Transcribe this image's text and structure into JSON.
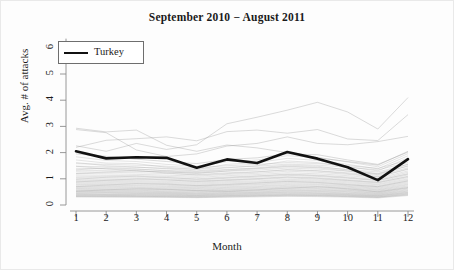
{
  "chart_data": {
    "type": "line",
    "title": "September 2010 − August 2011",
    "xlabel": "Month",
    "ylabel": "Avg. # of attacks",
    "xlim": [
      1,
      12
    ],
    "ylim": [
      0,
      6.4
    ],
    "xticks": [
      "1",
      "2",
      "3",
      "4",
      "5",
      "6",
      "7",
      "8",
      "9",
      "10",
      "11",
      "12"
    ],
    "yticks": [
      "0",
      "1",
      "2",
      "3",
      "4",
      "5",
      "6"
    ],
    "grid": false,
    "legend": {
      "position": "top-left",
      "entries": [
        "Turkey"
      ]
    },
    "x": [
      1,
      2,
      3,
      4,
      5,
      6,
      7,
      8,
      9,
      10,
      11,
      12
    ],
    "highlight_series": {
      "name": "Turkey",
      "color": "#111111",
      "width": 2.6,
      "values": [
        2.05,
        1.78,
        1.82,
        1.8,
        1.42,
        1.74,
        1.6,
        2.02,
        1.77,
        1.44,
        0.95,
        1.75
      ]
    },
    "background_series": [
      {
        "name": "bg-01",
        "values": [
          2.93,
          2.79,
          2.86,
          2.28,
          2.05,
          2.29,
          2.18,
          2.0,
          1.8,
          1.66,
          1.52,
          2.05
        ]
      },
      {
        "name": "bg-02",
        "values": [
          2.2,
          2.47,
          2.53,
          2.6,
          2.45,
          2.8,
          2.86,
          2.74,
          2.88,
          2.52,
          2.46,
          3.45
        ]
      },
      {
        "name": "bg-03",
        "values": [
          2.26,
          2.05,
          2.35,
          2.12,
          2.3,
          3.1,
          3.35,
          3.62,
          3.92,
          3.55,
          2.9,
          4.1
        ]
      },
      {
        "name": "bg-04",
        "values": [
          2.88,
          2.76,
          2.1,
          1.85,
          1.95,
          2.25,
          2.35,
          2.6,
          2.35,
          2.3,
          2.42,
          2.62
        ]
      },
      {
        "name": "bg-05",
        "values": [
          1.58,
          1.55,
          1.52,
          1.48,
          1.42,
          1.5,
          1.55,
          1.62,
          1.58,
          1.5,
          1.4,
          1.7
        ]
      },
      {
        "name": "bg-06",
        "values": [
          1.48,
          1.46,
          1.44,
          1.4,
          1.36,
          1.44,
          1.48,
          1.56,
          1.52,
          1.44,
          1.34,
          1.62
        ]
      },
      {
        "name": "bg-07",
        "values": [
          1.4,
          1.38,
          1.36,
          1.32,
          1.28,
          1.36,
          1.4,
          1.48,
          1.44,
          1.36,
          1.26,
          1.55
        ]
      },
      {
        "name": "bg-08",
        "values": [
          1.33,
          1.31,
          1.29,
          1.26,
          1.22,
          1.29,
          1.33,
          1.41,
          1.37,
          1.29,
          1.19,
          1.48
        ]
      },
      {
        "name": "bg-09",
        "values": [
          1.27,
          1.25,
          1.23,
          1.2,
          1.16,
          1.23,
          1.27,
          1.35,
          1.31,
          1.23,
          1.13,
          1.42
        ]
      },
      {
        "name": "bg-10",
        "values": [
          1.21,
          1.19,
          1.17,
          1.14,
          1.1,
          1.17,
          1.21,
          1.29,
          1.25,
          1.17,
          1.07,
          1.36
        ]
      },
      {
        "name": "bg-11",
        "values": [
          1.15,
          1.13,
          1.12,
          1.09,
          1.05,
          1.12,
          1.16,
          1.23,
          1.19,
          1.12,
          1.02,
          1.3
        ]
      },
      {
        "name": "bg-12",
        "values": [
          1.1,
          1.08,
          1.07,
          1.04,
          1.0,
          1.07,
          1.11,
          1.18,
          1.14,
          1.07,
          0.97,
          1.25
        ]
      },
      {
        "name": "bg-13",
        "values": [
          1.05,
          1.03,
          1.02,
          0.99,
          0.95,
          1.02,
          1.06,
          1.13,
          1.09,
          1.02,
          0.93,
          1.2
        ]
      },
      {
        "name": "bg-14",
        "values": [
          1.0,
          0.98,
          0.97,
          0.95,
          0.91,
          0.97,
          1.01,
          1.08,
          1.04,
          0.97,
          0.88,
          1.15
        ]
      },
      {
        "name": "bg-15",
        "values": [
          0.95,
          0.94,
          0.93,
          0.9,
          0.87,
          0.93,
          0.97,
          1.03,
          0.99,
          0.93,
          0.84,
          1.1
        ]
      },
      {
        "name": "bg-16",
        "values": [
          0.91,
          0.9,
          0.89,
          0.86,
          0.83,
          0.89,
          0.92,
          0.98,
          0.95,
          0.89,
          0.8,
          1.05
        ]
      },
      {
        "name": "bg-17",
        "values": [
          0.87,
          0.86,
          0.85,
          0.82,
          0.79,
          0.85,
          0.88,
          0.94,
          0.91,
          0.85,
          0.77,
          1.0
        ]
      },
      {
        "name": "bg-18",
        "values": [
          0.83,
          0.82,
          0.81,
          0.78,
          0.75,
          0.81,
          0.84,
          0.9,
          0.87,
          0.81,
          0.73,
          0.96
        ]
      },
      {
        "name": "bg-19",
        "values": [
          0.79,
          0.78,
          0.77,
          0.75,
          0.72,
          0.77,
          0.8,
          0.86,
          0.83,
          0.77,
          0.7,
          0.92
        ]
      },
      {
        "name": "bg-20",
        "values": [
          0.76,
          0.75,
          0.74,
          0.71,
          0.69,
          0.74,
          0.77,
          0.82,
          0.79,
          0.74,
          0.67,
          0.88
        ]
      },
      {
        "name": "bg-21",
        "values": [
          0.72,
          0.71,
          0.7,
          0.68,
          0.66,
          0.7,
          0.73,
          0.78,
          0.76,
          0.71,
          0.64,
          0.84
        ]
      },
      {
        "name": "bg-22",
        "values": [
          0.69,
          0.68,
          0.67,
          0.65,
          0.63,
          0.67,
          0.7,
          0.75,
          0.72,
          0.68,
          0.61,
          0.8
        ]
      },
      {
        "name": "bg-23",
        "values": [
          0.66,
          0.65,
          0.64,
          0.62,
          0.6,
          0.64,
          0.67,
          0.71,
          0.69,
          0.65,
          0.58,
          0.77
        ]
      },
      {
        "name": "bg-24",
        "values": [
          0.63,
          0.62,
          0.61,
          0.59,
          0.57,
          0.61,
          0.64,
          0.68,
          0.66,
          0.62,
          0.56,
          0.73
        ]
      },
      {
        "name": "bg-25",
        "values": [
          0.6,
          0.59,
          0.58,
          0.57,
          0.55,
          0.58,
          0.61,
          0.65,
          0.63,
          0.59,
          0.53,
          0.7
        ]
      },
      {
        "name": "bg-26",
        "values": [
          0.57,
          0.56,
          0.56,
          0.54,
          0.52,
          0.56,
          0.58,
          0.62,
          0.6,
          0.56,
          0.51,
          0.67
        ]
      },
      {
        "name": "bg-27",
        "values": [
          0.55,
          0.54,
          0.53,
          0.51,
          0.5,
          0.53,
          0.55,
          0.59,
          0.57,
          0.54,
          0.48,
          0.64
        ]
      },
      {
        "name": "bg-28",
        "values": [
          0.52,
          0.51,
          0.51,
          0.49,
          0.47,
          0.51,
          0.53,
          0.56,
          0.55,
          0.51,
          0.46,
          0.61
        ]
      },
      {
        "name": "bg-29",
        "values": [
          0.5,
          0.49,
          0.48,
          0.47,
          0.45,
          0.48,
          0.5,
          0.54,
          0.52,
          0.49,
          0.44,
          0.58
        ]
      },
      {
        "name": "bg-30",
        "values": [
          0.47,
          0.47,
          0.46,
          0.45,
          0.43,
          0.46,
          0.48,
          0.51,
          0.5,
          0.46,
          0.42,
          0.55
        ]
      },
      {
        "name": "bg-31",
        "values": [
          0.45,
          0.45,
          0.44,
          0.43,
          0.41,
          0.44,
          0.46,
          0.49,
          0.47,
          0.44,
          0.4,
          0.53
        ]
      },
      {
        "name": "bg-32",
        "values": [
          0.43,
          0.42,
          0.42,
          0.41,
          0.39,
          0.42,
          0.44,
          0.47,
          0.45,
          0.42,
          0.38,
          0.5
        ]
      },
      {
        "name": "bg-33",
        "values": [
          0.41,
          0.4,
          0.4,
          0.39,
          0.37,
          0.4,
          0.42,
          0.44,
          0.43,
          0.4,
          0.36,
          0.48
        ]
      },
      {
        "name": "bg-34",
        "values": [
          0.39,
          0.38,
          0.38,
          0.37,
          0.36,
          0.38,
          0.4,
          0.42,
          0.41,
          0.38,
          0.35,
          0.46
        ]
      },
      {
        "name": "bg-35",
        "values": [
          0.37,
          0.37,
          0.36,
          0.35,
          0.34,
          0.36,
          0.38,
          0.4,
          0.39,
          0.37,
          0.33,
          0.44
        ]
      },
      {
        "name": "bg-36",
        "values": [
          0.35,
          0.35,
          0.34,
          0.34,
          0.32,
          0.35,
          0.36,
          0.38,
          0.37,
          0.35,
          0.31,
          0.42
        ]
      },
      {
        "name": "bg-37",
        "values": [
          0.34,
          0.33,
          0.33,
          0.32,
          0.31,
          0.33,
          0.35,
          0.37,
          0.36,
          0.33,
          0.3,
          0.4
        ]
      },
      {
        "name": "bg-38",
        "values": [
          0.32,
          0.32,
          0.31,
          0.31,
          0.29,
          0.31,
          0.33,
          0.35,
          0.34,
          0.32,
          0.29,
          0.38
        ]
      },
      {
        "name": "bg-39",
        "values": [
          0.31,
          0.3,
          0.3,
          0.29,
          0.28,
          0.3,
          0.31,
          0.33,
          0.32,
          0.3,
          0.27,
          0.36
        ]
      },
      {
        "name": "bg-40",
        "values": [
          0.52,
          0.58,
          0.62,
          0.6,
          0.55,
          0.52,
          0.58,
          0.64,
          0.7,
          0.62,
          0.5,
          0.66
        ]
      },
      {
        "name": "bg-41",
        "values": [
          1.62,
          1.5,
          1.45,
          1.38,
          1.3,
          1.42,
          1.5,
          1.68,
          1.62,
          1.46,
          1.3,
          1.8
        ]
      },
      {
        "name": "bg-42",
        "values": [
          1.72,
          1.6,
          1.58,
          1.44,
          1.36,
          1.55,
          1.62,
          1.78,
          1.7,
          1.55,
          1.38,
          1.88
        ]
      },
      {
        "name": "bg-43",
        "values": [
          1.84,
          1.7,
          1.66,
          1.55,
          1.48,
          1.65,
          1.72,
          1.88,
          1.82,
          1.64,
          1.46,
          1.96
        ]
      },
      {
        "name": "bg-44",
        "values": [
          1.95,
          1.86,
          1.75,
          1.66,
          1.58,
          1.74,
          1.8,
          1.95,
          1.92,
          1.72,
          1.55,
          2.02
        ]
      },
      {
        "name": "bg-45",
        "values": [
          1.2,
          1.26,
          1.32,
          1.22,
          1.14,
          1.2,
          1.26,
          1.34,
          1.3,
          1.2,
          1.08,
          1.38
        ]
      },
      {
        "name": "bg-46",
        "values": [
          0.88,
          0.94,
          1.0,
          0.96,
          0.9,
          0.95,
          1.0,
          1.06,
          1.02,
          0.94,
          0.86,
          1.08
        ]
      },
      {
        "name": "bg-47",
        "values": [
          0.7,
          0.76,
          0.82,
          0.8,
          0.74,
          0.78,
          0.84,
          0.9,
          0.86,
          0.78,
          0.7,
          0.92
        ]
      },
      {
        "name": "bg-48",
        "values": [
          1.48,
          1.38,
          1.3,
          1.26,
          1.2,
          1.3,
          1.38,
          1.46,
          1.42,
          1.3,
          1.16,
          1.5
        ]
      },
      {
        "name": "bg-49",
        "values": [
          0.98,
          1.06,
          1.1,
          1.05,
          0.98,
          1.04,
          1.1,
          1.16,
          1.12,
          1.04,
          0.94,
          1.18
        ]
      },
      {
        "name": "bg-50",
        "values": [
          1.34,
          1.42,
          1.38,
          1.3,
          1.24,
          1.34,
          1.42,
          1.52,
          1.48,
          1.34,
          1.2,
          1.56
        ]
      }
    ]
  }
}
